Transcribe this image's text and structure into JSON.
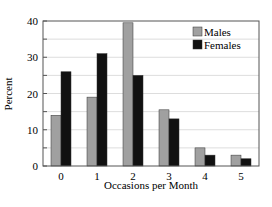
{
  "chart_data": {
    "type": "bar",
    "title": "",
    "xlabel": "Occasions per Month",
    "ylabel": "Percent",
    "categories": [
      "0",
      "1",
      "2",
      "3",
      "4",
      "5"
    ],
    "series": [
      {
        "name": "Males",
        "color": "#a0a0a0",
        "values": [
          14,
          19,
          39.5,
          15.5,
          5,
          3
        ]
      },
      {
        "name": "Females",
        "color": "#111111",
        "values": [
          26,
          31,
          25,
          13,
          3,
          2
        ]
      }
    ],
    "ylim": [
      0,
      40
    ],
    "yticks": [
      0,
      10,
      20,
      30,
      40
    ],
    "grid": true,
    "legend_position": "upper right"
  }
}
